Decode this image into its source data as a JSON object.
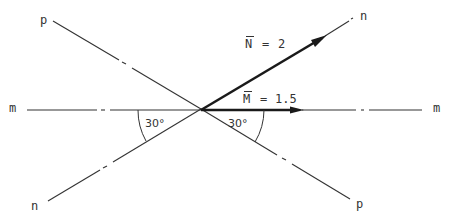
{
  "diagram": {
    "type": "vector diagram",
    "center": {
      "x": 201,
      "y": 109
    },
    "lines": {
      "p": {
        "label_start": "p",
        "label_end": "p"
      },
      "n": {
        "label_start": "n",
        "label_end": "n"
      },
      "m": {
        "label_start": "m",
        "label_end": "m"
      }
    },
    "vectors": {
      "N": {
        "symbol": "N",
        "label": "N = 2",
        "equals": "=",
        "value": "2"
      },
      "M": {
        "symbol": "M",
        "label": "M = 1.5",
        "equals": "=",
        "value": "1.5"
      }
    },
    "angles": {
      "left": "30°",
      "right": "30°"
    },
    "colors": {
      "line": "#333333",
      "vector": "#1a1a1a",
      "background": "#ffffff"
    }
  }
}
